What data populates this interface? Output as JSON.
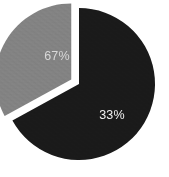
{
  "chart_data": {
    "type": "pie",
    "title": "",
    "subtitle": "",
    "xlabel": "",
    "ylabel": "",
    "grid": false,
    "legend": "none",
    "labels_position": "inside",
    "exploded_slice_index": 1,
    "categories": [
      "Segment 1",
      "Segment 2"
    ],
    "values": [
      67,
      33
    ],
    "value_unit": "%",
    "data_labels": [
      "67%",
      "33%"
    ],
    "colors": [
      "#1a1a1a",
      "#838383"
    ],
    "label_colors": [
      "#d8d8d8",
      "#f2f2f2"
    ],
    "separator_color": "#ffffff",
    "background": "#ffffff"
  },
  "geometry": {
    "center_x": 79,
    "center_y": 84,
    "radius": 76,
    "start_angle_deg": -90,
    "explode_offset_px": 9,
    "separator_width_px": 3,
    "label_67_x": 57,
    "label_67_y": 57,
    "label_33_x": 112,
    "label_33_y": 116
  }
}
